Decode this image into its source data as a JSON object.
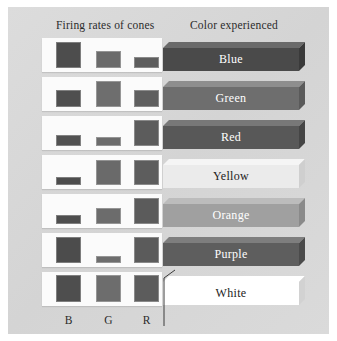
{
  "figure": {
    "headers": {
      "firing": "Firing rates of cones",
      "color": "Color experienced"
    },
    "axis_labels": [
      "B",
      "G",
      "R"
    ],
    "background_color": "#d8d8d8",
    "strip_color": "#fbfbfb",
    "cone_bar_color": "#555555"
  },
  "chart_data": {
    "type": "bar",
    "xlabel": "",
    "ylabel": "Firing rate",
    "categories": [
      "B",
      "G",
      "R"
    ],
    "ylim": [
      0,
      100
    ],
    "grid": false,
    "legend": "none",
    "series": [
      {
        "name": "Blue",
        "values": [
          92,
          62,
          38
        ],
        "label": "Blue",
        "bar_color": "#4a4a4a",
        "bar_top_color": "#6a6a6a",
        "bar_side_color": "#3a3a3a",
        "text_color": "#ffffff"
      },
      {
        "name": "Green",
        "values": [
          62,
          92,
          62
        ],
        "label": "Green",
        "bar_color": "#6e6e6e",
        "bar_top_color": "#8e8e8e",
        "bar_side_color": "#5a5a5a",
        "text_color": "#ffffff"
      },
      {
        "name": "Red",
        "values": [
          40,
          32,
          92
        ],
        "label": "Red",
        "bar_color": "#585858",
        "bar_top_color": "#787878",
        "bar_side_color": "#454545",
        "text_color": "#ffffff"
      },
      {
        "name": "Yellow",
        "values": [
          28,
          88,
          88
        ],
        "label": "Yellow",
        "bar_color": "#ebebeb",
        "bar_top_color": "#f5f5f5",
        "bar_side_color": "#cfcfcf",
        "text_color": "#222222"
      },
      {
        "name": "Orange",
        "values": [
          32,
          58,
          92
        ],
        "label": "Orange",
        "bar_color": "#a0a0a0",
        "bar_top_color": "#bcbcbc",
        "bar_side_color": "#8a8a8a",
        "text_color": "#ffffff"
      },
      {
        "name": "Purple",
        "values": [
          92,
          25,
          92
        ],
        "label": "Purple",
        "bar_color": "#5e5e5e",
        "bar_top_color": "#7e7e7e",
        "bar_side_color": "#4b4b4b",
        "text_color": "#ffffff"
      },
      {
        "name": "White",
        "values": [
          95,
          95,
          95
        ],
        "label": "White",
        "bar_color": "#ffffff",
        "bar_top_color": "#ffffff",
        "bar_side_color": "#d2d2d2",
        "text_color": "#222222"
      }
    ],
    "cone_shades": {
      "Blue": [
        "#4d4d4d",
        "#6b6b6b",
        "#5e5e5e"
      ],
      "Green": [
        "#4f4f4f",
        "#6e6e6e",
        "#5f5f5f"
      ],
      "Red": [
        "#525252",
        "#6c6c6c",
        "#5c5c5c"
      ],
      "Yellow": [
        "#4d4d4d",
        "#6a6a6a",
        "#5d5d5d"
      ],
      "Orange": [
        "#4e4e4e",
        "#6c6c6c",
        "#5b5b5b"
      ],
      "Purple": [
        "#4c4c4c",
        "#6d6d6d",
        "#5b5b5b"
      ],
      "White": [
        "#4e4e4e",
        "#6d6d6d",
        "#5c5c5c"
      ]
    }
  }
}
